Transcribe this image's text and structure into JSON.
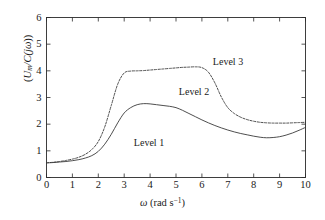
{
  "chart_data": {
    "type": "line",
    "title": "",
    "xlabel": "ω (rad s⁻¹)",
    "ylabel": "(Uₘ/C(jω))",
    "xlim": [
      0,
      10
    ],
    "ylim": [
      0,
      6
    ],
    "xticks": [
      0,
      1,
      2,
      3,
      4,
      5,
      6,
      7,
      8,
      9,
      10
    ],
    "yticks": [
      0,
      1,
      2,
      3,
      4,
      5,
      6
    ],
    "grid": false,
    "legend_position": "inline-annotations",
    "x": [
      0,
      0.25,
      0.5,
      0.75,
      1.0,
      1.25,
      1.5,
      1.75,
      2.0,
      2.25,
      2.5,
      2.75,
      3.0,
      3.25,
      3.5,
      3.75,
      4.0,
      4.25,
      4.5,
      4.75,
      5.0,
      5.25,
      5.5,
      5.75,
      6.0,
      6.25,
      6.5,
      6.75,
      7.0,
      7.25,
      7.5,
      7.75,
      8.0,
      8.25,
      8.5,
      8.75,
      9.0,
      9.25,
      9.5,
      9.75,
      10.0
    ],
    "series": [
      {
        "name": "Level 1",
        "style": "solid",
        "color": "#3a3a3a",
        "values": [
          0.55,
          0.56,
          0.58,
          0.6,
          0.63,
          0.67,
          0.73,
          0.82,
          0.98,
          1.25,
          1.62,
          2.05,
          2.42,
          2.62,
          2.73,
          2.77,
          2.76,
          2.73,
          2.7,
          2.67,
          2.62,
          2.52,
          2.4,
          2.28,
          2.16,
          2.05,
          1.95,
          1.86,
          1.78,
          1.71,
          1.65,
          1.6,
          1.55,
          1.51,
          1.49,
          1.5,
          1.53,
          1.59,
          1.67,
          1.77,
          1.88
        ]
      },
      {
        "name": "Level 2",
        "style": "dashed",
        "color": "#3a3a3a",
        "values": [
          0.55,
          0.57,
          0.6,
          0.64,
          0.69,
          0.76,
          0.87,
          1.05,
          1.35,
          1.9,
          2.7,
          3.5,
          3.92,
          3.99,
          4.0,
          4.01,
          4.03,
          4.05,
          4.07,
          4.09,
          4.11,
          4.13,
          4.14,
          4.15,
          4.12,
          3.95,
          3.55,
          3.02,
          2.62,
          2.4,
          2.26,
          2.17,
          2.11,
          2.07,
          2.05,
          2.04,
          2.04,
          2.04,
          2.05,
          2.06,
          2.07
        ]
      }
    ],
    "annotations": [
      {
        "text": "Level 1",
        "x": 3.95,
        "y": 1.38
      },
      {
        "text": "Level 2",
        "x": 5.7,
        "y": 3.3
      },
      {
        "text": "Level 3",
        "x": 7.0,
        "y": 4.43
      }
    ]
  },
  "axes": {
    "x_tick_labels": [
      "0",
      "1",
      "2",
      "3",
      "4",
      "5",
      "6",
      "7",
      "8",
      "9",
      "10"
    ],
    "y_tick_labels": [
      "0",
      "1",
      "2",
      "3",
      "4",
      "5",
      "6"
    ],
    "xlabel_symbol": "ω",
    "xlabel_unit_open": " (rad s",
    "xlabel_unit_sup": "−1",
    "xlabel_unit_close": ")",
    "ylabel_open": "(",
    "ylabel_u": "U",
    "ylabel_u_sub": "m",
    "ylabel_mid": "/C(j",
    "ylabel_omega": "ω",
    "ylabel_close": "))"
  },
  "style": {
    "axis_color": "#2b2b2b",
    "curve_color": "#3a3a3a",
    "background": "#ffffff"
  }
}
